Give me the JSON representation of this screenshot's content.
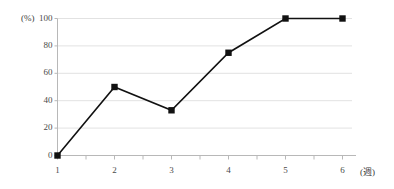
{
  "chart_data": {
    "type": "line",
    "title": "",
    "xlabel": "(週)",
    "ylabel": "(%)",
    "x": [
      1,
      2,
      3,
      4,
      5,
      6
    ],
    "categories": [
      "1",
      "2",
      "3",
      "4",
      "5",
      "6"
    ],
    "values": [
      0,
      50,
      33,
      75,
      100,
      100
    ],
    "series": [
      {
        "name": "",
        "values": [
          0,
          50,
          33,
          75,
          100,
          100
        ]
      }
    ],
    "ylim": [
      0,
      100
    ],
    "xlim": [
      1,
      6
    ],
    "ytick_labels": [
      "0",
      "20",
      "40",
      "60",
      "80",
      "100"
    ],
    "yticks": [
      0,
      20,
      40,
      60,
      80,
      100
    ],
    "xtick_labels": [
      "1",
      "2",
      "3",
      "4",
      "5",
      "6"
    ],
    "grid": true,
    "grid_axis": "y",
    "legend": false,
    "legend_position": "none",
    "marker": "square",
    "line_color": "#111111",
    "marker_color": "#111111",
    "grid_color": "#e2e2e2",
    "axis_color": "#b8b8b8"
  },
  "axes": {
    "y_unit_label": "(%)",
    "x_unit_label": "(週)"
  }
}
